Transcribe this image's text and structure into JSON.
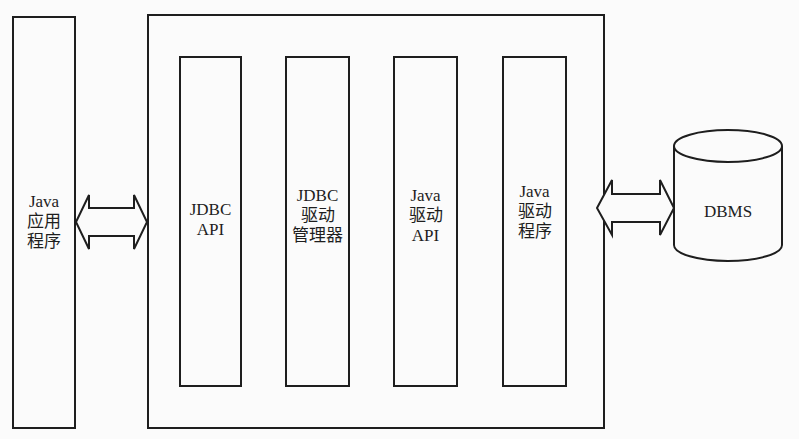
{
  "diagram": {
    "left_component": {
      "lines": [
        "Java",
        "应用",
        "程序"
      ]
    },
    "jdbc_container": {
      "layers": [
        {
          "id": "jdbc-api",
          "lines": [
            "JDBC",
            "API"
          ]
        },
        {
          "id": "jdbc-driver-manager",
          "lines": [
            "JDBC",
            "驱动",
            "管理器"
          ]
        },
        {
          "id": "java-driver-api",
          "lines": [
            "Java",
            "驱动",
            "API"
          ]
        },
        {
          "id": "java-driver",
          "lines": [
            "Java",
            "驱动",
            "程序"
          ]
        }
      ]
    },
    "database": {
      "label": "DBMS"
    },
    "connections": [
      {
        "from": "left_component",
        "to": "jdbc_container",
        "type": "bidirectional"
      },
      {
        "from": "jdbc_container",
        "to": "database",
        "type": "bidirectional"
      }
    ],
    "colors": {
      "stroke": "#1e1e1e",
      "background": "#fbfbfb"
    }
  }
}
